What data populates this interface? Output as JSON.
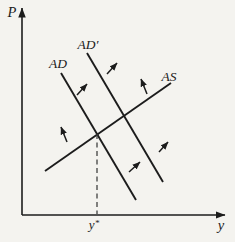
{
  "figure": {
    "width": 235,
    "height": 242,
    "background": "#f4f3ef",
    "ink": "#1c1c1c",
    "dash_color": "#3a3a3a",
    "axes": {
      "vertical_label": "P",
      "horizontal_label": "y",
      "origin": [
        22,
        215
      ],
      "vertical_top": [
        22,
        8
      ],
      "horizontal_right": [
        225,
        215
      ],
      "vertical_label_pos": [
        12,
        17
      ],
      "horizontal_label_pos": [
        221,
        230
      ]
    },
    "curves": [
      {
        "id": "ad-curve",
        "label": "AD",
        "from": [
          61,
          73
        ],
        "to": [
          136,
          200
        ],
        "label_pos": [
          58,
          68
        ]
      },
      {
        "id": "ad-prime-curve",
        "label": "AD′",
        "from": [
          87,
          53
        ],
        "to": [
          163,
          182
        ],
        "label_pos": [
          88,
          49
        ]
      },
      {
        "id": "as-curve",
        "label": "AS",
        "from": [
          45,
          171
        ],
        "to": [
          171,
          83
        ],
        "label_pos": [
          169,
          81
        ]
      }
    ],
    "equilibrium": {
      "dashed_from": [
        97,
        134
      ],
      "dashed_to": [
        97,
        214
      ],
      "label": "y*",
      "label_pos": [
        94,
        229
      ]
    },
    "adjustment_arrows": [
      {
        "from": [
          107,
          74
        ],
        "to": [
          117,
          63
        ]
      },
      {
        "from": [
          77,
          95
        ],
        "to": [
          87,
          84
        ]
      },
      {
        "from": [
          147,
          94
        ],
        "to": [
          141,
          79
        ]
      },
      {
        "from": [
          67,
          142
        ],
        "to": [
          61,
          127
        ]
      },
      {
        "from": [
          129,
          172
        ],
        "to": [
          140,
          162
        ]
      },
      {
        "from": [
          159,
          152
        ],
        "to": [
          168,
          142
        ]
      }
    ]
  }
}
